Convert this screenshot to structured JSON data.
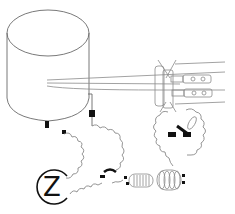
{
  "diagram": {
    "title": "",
    "components": [
      {
        "id": "cylinder",
        "label": "cylindrical vessel"
      },
      {
        "id": "needles",
        "label": "two parallel probe wires"
      },
      {
        "id": "clamp",
        "label": "clamp fixture with connectors"
      },
      {
        "id": "coil-left",
        "label": "small coil"
      },
      {
        "id": "coil-right",
        "label": "large coil"
      },
      {
        "id": "impedance-symbol",
        "label": "Z"
      }
    ],
    "symbol_text": "Z",
    "colors": {
      "line": "#7a7a7a",
      "ink": "#111111",
      "background": "#ffffff"
    }
  }
}
